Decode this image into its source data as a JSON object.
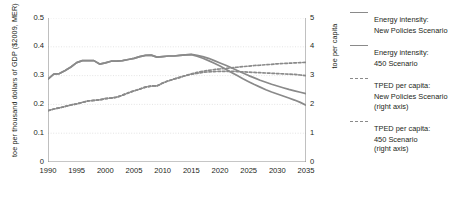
{
  "chart_data": {
    "type": "line",
    "title": "",
    "xlabel": "",
    "ylabel": "toe per thousand dollars of GDP ($2009, MER)",
    "ylabel_right": "toe per capita",
    "xlim": [
      1990,
      2035
    ],
    "ylim": [
      0,
      0.5
    ],
    "ylim_right": [
      0,
      5
    ],
    "grid": true,
    "legend_position": "right",
    "xticks": [
      "1990",
      "1995",
      "2000",
      "2005",
      "2010",
      "2015",
      "2020",
      "2025",
      "2030",
      "2035"
    ],
    "yticks_left": [
      "0",
      "0.1",
      "0.2",
      "0.3",
      "0.4",
      "0.5"
    ],
    "yticks_right": [
      "0",
      "1",
      "2",
      "3",
      "4",
      "5"
    ],
    "x": [
      1990,
      1991,
      1992,
      1993,
      1994,
      1995,
      1996,
      1997,
      1998,
      1999,
      2000,
      2001,
      2002,
      2003,
      2004,
      2005,
      2006,
      2007,
      2008,
      2009,
      2010,
      2011,
      2012,
      2013,
      2014,
      2015,
      2016,
      2017,
      2018,
      2019,
      2020,
      2021,
      2022,
      2023,
      2024,
      2025,
      2026,
      2027,
      2028,
      2029,
      2030,
      2031,
      2032,
      2033,
      2034,
      2035
    ],
    "series": [
      {
        "name": "Energy intensity: New Policies Scenario",
        "axis": "left",
        "style": "solid",
        "color": "#8a8a8a",
        "values": [
          0.288,
          0.305,
          0.307,
          0.318,
          0.33,
          0.345,
          0.352,
          0.352,
          0.352,
          0.34,
          0.344,
          0.35,
          0.35,
          0.352,
          0.356,
          0.36,
          0.366,
          0.37,
          0.371,
          0.364,
          0.366,
          0.368,
          0.368,
          0.37,
          0.372,
          0.374,
          0.37,
          0.366,
          0.36,
          0.352,
          0.344,
          0.336,
          0.327,
          0.318,
          0.309,
          0.3,
          0.292,
          0.284,
          0.277,
          0.27,
          0.264,
          0.258,
          0.252,
          0.247,
          0.242,
          0.237
        ]
      },
      {
        "name": "Energy intensity: 450 Scenario",
        "axis": "left",
        "style": "solid",
        "color": "#8a8a8a",
        "values": [
          0.288,
          0.305,
          0.307,
          0.318,
          0.33,
          0.345,
          0.352,
          0.352,
          0.352,
          0.34,
          0.344,
          0.35,
          0.35,
          0.352,
          0.356,
          0.36,
          0.366,
          0.37,
          0.371,
          0.364,
          0.366,
          0.368,
          0.368,
          0.37,
          0.372,
          0.373,
          0.367,
          0.36,
          0.352,
          0.343,
          0.333,
          0.322,
          0.311,
          0.3,
          0.289,
          0.279,
          0.269,
          0.26,
          0.251,
          0.243,
          0.236,
          0.229,
          0.222,
          0.215,
          0.207,
          0.197
        ]
      },
      {
        "name": "TPED per capita: New Policies Scenario (right axis)",
        "axis": "right",
        "style": "dashed",
        "color": "#8a8a8a",
        "values": [
          1.78,
          1.84,
          1.88,
          1.93,
          1.98,
          2.02,
          2.07,
          2.12,
          2.14,
          2.16,
          2.2,
          2.22,
          2.25,
          2.32,
          2.4,
          2.47,
          2.53,
          2.6,
          2.64,
          2.64,
          2.74,
          2.82,
          2.88,
          2.94,
          3.0,
          3.06,
          3.11,
          3.15,
          3.18,
          3.21,
          3.23,
          3.25,
          3.27,
          3.29,
          3.31,
          3.33,
          3.35,
          3.36,
          3.38,
          3.39,
          3.41,
          3.42,
          3.43,
          3.44,
          3.45,
          3.46
        ]
      },
      {
        "name": "TPED per capita: 450 Scenario (right axis)",
        "axis": "right",
        "style": "dashed",
        "color": "#8a8a8a",
        "values": [
          1.78,
          1.84,
          1.88,
          1.93,
          1.98,
          2.02,
          2.07,
          2.12,
          2.14,
          2.16,
          2.2,
          2.22,
          2.25,
          2.32,
          2.4,
          2.47,
          2.53,
          2.6,
          2.64,
          2.64,
          2.74,
          2.82,
          2.88,
          2.94,
          3.0,
          3.05,
          3.08,
          3.11,
          3.13,
          3.14,
          3.15,
          3.15,
          3.15,
          3.14,
          3.13,
          3.12,
          3.11,
          3.1,
          3.09,
          3.08,
          3.07,
          3.06,
          3.05,
          3.04,
          3.02,
          3.0
        ]
      }
    ]
  },
  "legend": {
    "items": [
      {
        "style": "solid",
        "line1": "Energy intensity:",
        "line2": "New Policies Scenario",
        "line3": ""
      },
      {
        "style": "solid",
        "line1": "Energy intensity:",
        "line2": "450 Scenario",
        "line3": ""
      },
      {
        "style": "dashed",
        "line1": "TPED per capita:",
        "line2": "New Policies Scenario",
        "line3": "(right axis)"
      },
      {
        "style": "dashed",
        "line1": "TPED per capita:",
        "line2": "450 Scenario",
        "line3": "(right axis)"
      }
    ]
  },
  "colors": {
    "line": "#8a8a8a",
    "axis": "#808080",
    "grid": "#d9d9d9",
    "text": "#231f20"
  }
}
